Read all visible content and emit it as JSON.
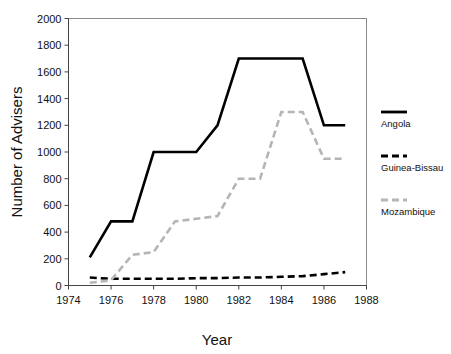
{
  "chart_data": {
    "type": "line",
    "title": "",
    "xlabel": "Year",
    "ylabel": "Number of Advisers",
    "xlim": [
      1974,
      1988
    ],
    "ylim": [
      0,
      2000
    ],
    "xticks": [
      1974,
      1976,
      1978,
      1980,
      1982,
      1984,
      1986,
      1988
    ],
    "yticks": [
      0,
      200,
      400,
      600,
      800,
      1000,
      1200,
      1400,
      1600,
      1800,
      2000
    ],
    "grid": false,
    "legend_position": "right",
    "series": [
      {
        "name": "Angola",
        "style": "solid",
        "color": "#000000",
        "x": [
          1975,
          1976,
          1977,
          1978,
          1979,
          1980,
          1981,
          1982,
          1983,
          1984,
          1985,
          1986,
          1987
        ],
        "values": [
          210,
          480,
          480,
          1000,
          1000,
          1000,
          1200,
          1700,
          1700,
          1700,
          1700,
          1200,
          1200
        ]
      },
      {
        "name": "Guinea-Bissau",
        "style": "dashed",
        "color": "#000000",
        "x": [
          1975,
          1976,
          1977,
          1978,
          1979,
          1980,
          1981,
          1982,
          1983,
          1984,
          1985,
          1986,
          1987
        ],
        "values": [
          60,
          50,
          50,
          50,
          50,
          55,
          55,
          60,
          60,
          65,
          70,
          85,
          100
        ]
      },
      {
        "name": "Mozambique",
        "style": "dashed",
        "color": "#b5b5b5",
        "x": [
          1975,
          1976,
          1977,
          1978,
          1979,
          1980,
          1981,
          1982,
          1983,
          1984,
          1985,
          1986,
          1987
        ],
        "values": [
          20,
          40,
          230,
          250,
          480,
          500,
          520,
          800,
          800,
          1300,
          1300,
          950,
          950
        ]
      }
    ]
  },
  "axes": {
    "x_title": "Year",
    "y_title": "Number of Advisers",
    "x_tick_labels": [
      "1974",
      "1976",
      "1978",
      "1980",
      "1982",
      "1984",
      "1986",
      "1988"
    ],
    "y_tick_labels": [
      "0",
      "200",
      "400",
      "600",
      "800",
      "1000",
      "1200",
      "1400",
      "1600",
      "1800",
      "2000"
    ]
  },
  "legend": {
    "entries": [
      {
        "label": "Angola",
        "swatch": "solid-black-line-swatch"
      },
      {
        "label": "Guinea-Bissau",
        "swatch": "dashed-black-line-swatch"
      },
      {
        "label": "Mozambique",
        "swatch": "dashed-gray-line-swatch"
      }
    ]
  },
  "colors": {
    "angola": "#000000",
    "guinea_bissau": "#000000",
    "mozambique": "#b5b5b5",
    "frame": "#8a8a8a",
    "text": "#111111"
  }
}
